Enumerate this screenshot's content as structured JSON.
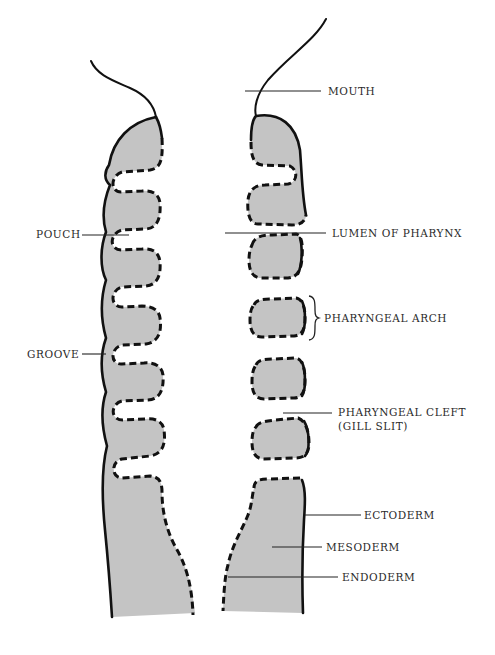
{
  "diagram": {
    "colors": {
      "tissue_fill": "#c4c4c4",
      "outline": "#111111",
      "text": "#2a2a2a",
      "background": "#ffffff"
    },
    "labels": {
      "mouth": "MOUTH",
      "lumen_of_pharynx": "LUMEN OF PHARYNX",
      "pharyngeal_arch": "PHARYNGEAL ARCH",
      "pharyngeal_cleft_line1": "PHARYNGEAL CLEFT",
      "pharyngeal_cleft_line2": "(GILL SLIT)",
      "ectoderm": "ECTODERM",
      "mesoderm": "MESODERM",
      "endoderm": "ENDODERM",
      "pouch": "POUCH",
      "groove": "GROOVE"
    },
    "legend": {
      "solid_line": "ectoderm",
      "dashed_line": "endoderm",
      "gray_fill": "mesoderm"
    }
  }
}
